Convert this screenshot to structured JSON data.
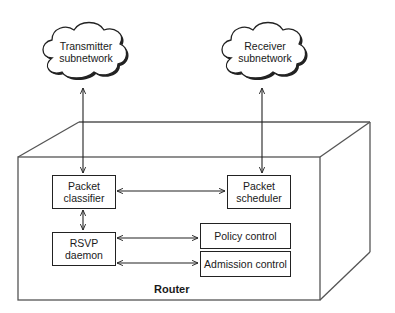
{
  "diagram": {
    "clouds": [
      {
        "id": "transmitter",
        "line1": "Transmitter",
        "line2": "subnetwork"
      },
      {
        "id": "receiver",
        "line1": "Receiver",
        "line2": "subnetwork"
      }
    ],
    "container": {
      "label": "Router"
    },
    "boxes": {
      "packet_classifier": {
        "line1": "Packet",
        "line2": "classifier"
      },
      "packet_scheduler": {
        "line1": "Packet",
        "line2": "scheduler"
      },
      "rsvp_daemon": {
        "line1": "RSVP",
        "line2": "daemon"
      },
      "policy_control": {
        "label": "Policy control"
      },
      "admission_control": {
        "label": "Admission control"
      }
    },
    "connections": [
      {
        "from": "Transmitter subnetwork",
        "to": "Packet classifier",
        "type": "bidirectional"
      },
      {
        "from": "Receiver subnetwork",
        "to": "Packet scheduler",
        "type": "bidirectional"
      },
      {
        "from": "Packet classifier",
        "to": "Packet scheduler",
        "type": "bidirectional"
      },
      {
        "from": "Packet classifier",
        "to": "RSVP daemon",
        "type": "bidirectional"
      },
      {
        "from": "RSVP daemon",
        "to": "Policy control",
        "type": "bidirectional"
      },
      {
        "from": "RSVP daemon",
        "to": "Admission control",
        "type": "bidirectional"
      }
    ],
    "colors": {
      "line": "#222222",
      "box_line": "#555555",
      "background": "#ffffff"
    }
  }
}
